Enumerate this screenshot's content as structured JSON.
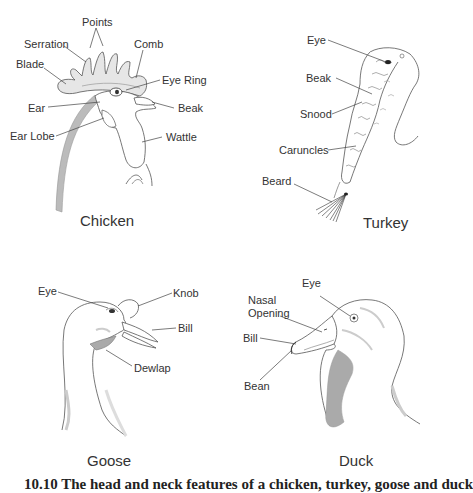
{
  "panels": {
    "chicken": {
      "title": "Chicken",
      "labels": {
        "points": "Points",
        "serration": "Serration",
        "comb": "Comb",
        "blade": "Blade",
        "eye_ring": "Eye Ring",
        "ear": "Ear",
        "beak": "Beak",
        "ear_lobe": "Ear Lobe",
        "wattle": "Wattle"
      }
    },
    "turkey": {
      "title": "Turkey",
      "labels": {
        "eye": "Eye",
        "beak": "Beak",
        "snood": "Snood",
        "caruncles": "Caruncles",
        "beard": "Beard"
      }
    },
    "goose": {
      "title": "Goose",
      "labels": {
        "eye": "Eye",
        "knob": "Knob",
        "bill": "Bill",
        "dewlap": "Dewlap"
      }
    },
    "duck": {
      "title": "Duck",
      "labels": {
        "eye": "Eye",
        "nasal_opening_1": "Nasal",
        "nasal_opening_2": "Opening",
        "bill": "Bill",
        "bean": "Bean"
      }
    }
  },
  "caption": "10.10 The head and neck features of a chicken, turkey, goose and duck"
}
